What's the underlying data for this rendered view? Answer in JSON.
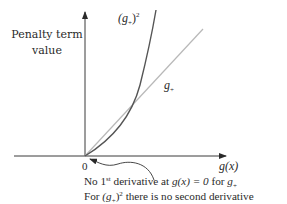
{
  "diagram": {
    "y_axis_label_line1": "Penalty term",
    "y_axis_label_line2": "value",
    "x_axis_label": "g(x)",
    "origin_label": "0",
    "curve_squared_label": {
      "base": "(g",
      "sub": "+",
      "close": ")",
      "sup": "2"
    },
    "curve_linear_label": {
      "base": "g",
      "sub": "+"
    },
    "note_line1": {
      "pre": "No 1",
      "sup": "st",
      "mid": " derivative at ",
      "expr": "g(x) = 0",
      "post": " for ",
      "g": "g",
      "sub": "+"
    },
    "note_line2": {
      "pre": "For ",
      "expr": "(g",
      "sub": "+",
      "close": ")",
      "sup": "2",
      "post": " there is no second derivative"
    },
    "colors": {
      "axis": "#3a3a3a",
      "squared_curve": "#555555",
      "linear_curve": "#b8b8b8",
      "text": "#2a2a2a"
    }
  }
}
